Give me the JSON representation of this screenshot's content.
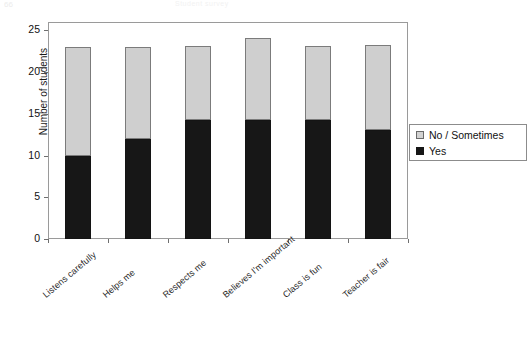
{
  "ghost": {
    "corner_text": "66",
    "top_text": "Student survey"
  },
  "legend": {
    "position": "right",
    "items": [
      {
        "label": "No / Sometimes",
        "swatch": "legend-swatch-gray",
        "color": "#d2d2d2"
      },
      {
        "label": "Yes",
        "swatch": "legend-swatch-black",
        "color": "#161616"
      }
    ]
  },
  "axes": {
    "y_title": "Number of students",
    "y_ticks": [
      "0",
      "5",
      "10",
      "15",
      "20",
      "25"
    ]
  },
  "chart_data": {
    "type": "bar",
    "stacked": true,
    "title": "",
    "xlabel": "",
    "ylabel": "Number of students",
    "ylim": [
      0,
      26
    ],
    "yticks": [
      0,
      5,
      10,
      15,
      20,
      25
    ],
    "grid": false,
    "legend_position": "right",
    "categories": [
      "Listens carefully",
      "Helps me",
      "Respects me",
      "Believes I'm important",
      "Class is fun",
      "Teacher is fair"
    ],
    "series": [
      {
        "name": "Yes",
        "color": "#161616",
        "values": [
          10,
          12,
          14.2,
          14.2,
          14.2,
          13.1
        ]
      },
      {
        "name": "No / Sometimes",
        "color": "#d2d2d2",
        "values": [
          13,
          11,
          8.9,
          9.9,
          8.9,
          10.1
        ]
      }
    ],
    "totals": [
      23,
      23,
      23.1,
      24.1,
      23.1,
      23.2
    ]
  }
}
